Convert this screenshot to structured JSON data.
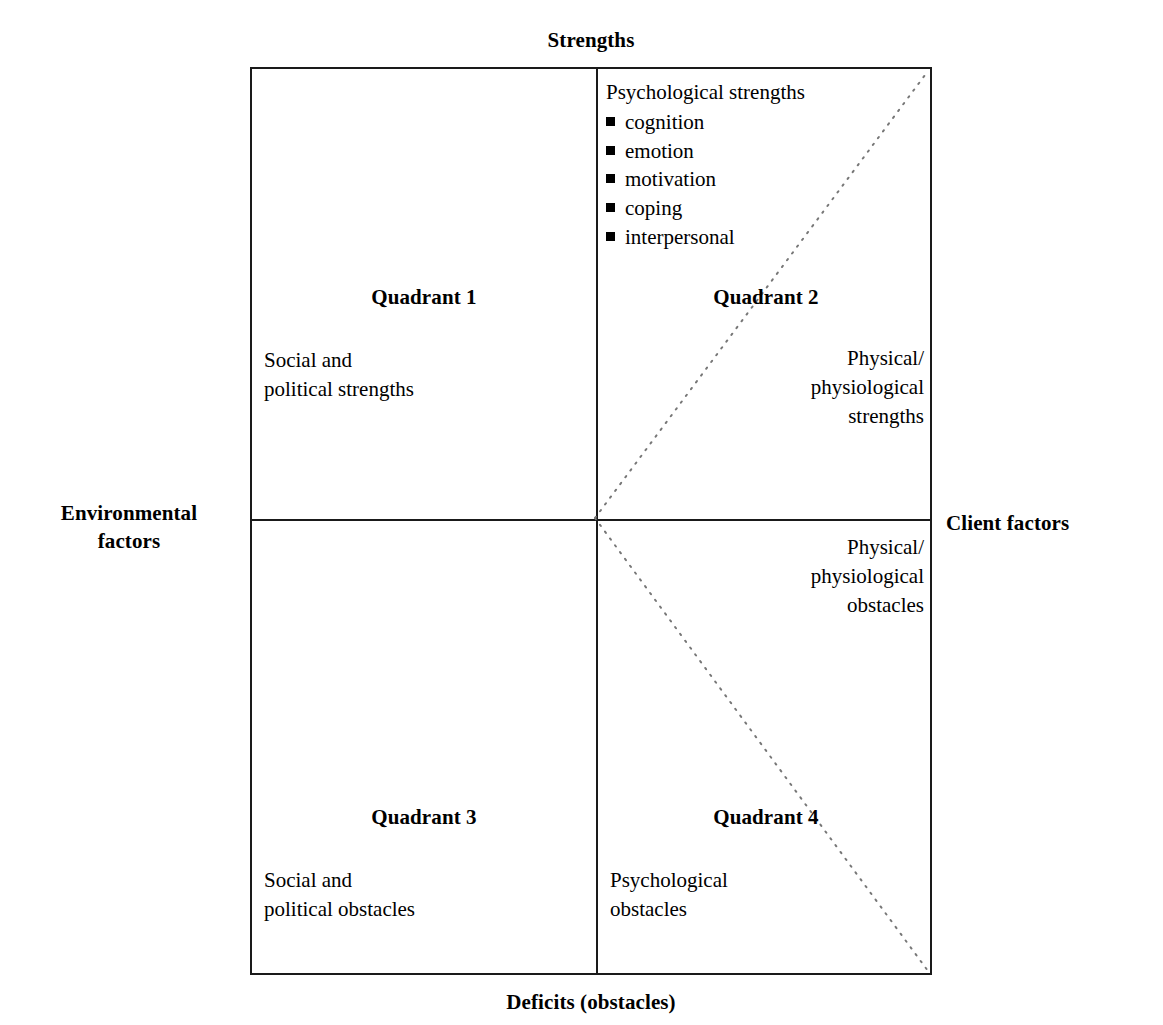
{
  "axes": {
    "top": "Strengths",
    "bottom": "Deficits (obstacles)",
    "left": "Environmental\nfactors",
    "right": "Client factors"
  },
  "strengths_list": {
    "heading": "Psychological strengths",
    "items": [
      "cognition",
      "emotion",
      "motivation",
      "coping",
      "interpersonal"
    ]
  },
  "quadrants": {
    "q1": {
      "title": "Quadrant 1",
      "body": "Social and\npolitical strengths"
    },
    "q2": {
      "title": "Quadrant 2",
      "body": "Physical/\nphysiological\nstrengths"
    },
    "q3": {
      "title": "Quadrant 3",
      "body": "Social and\npolitical obstacles"
    },
    "q4": {
      "title": "Quadrant 4",
      "body": "Psychological\nobstacles",
      "note": "Physical/\nphysiological\nobstacles"
    }
  },
  "colors": {
    "line": "#1a1a1a",
    "dotted": "#777777",
    "text": "#000000",
    "background": "#ffffff"
  }
}
